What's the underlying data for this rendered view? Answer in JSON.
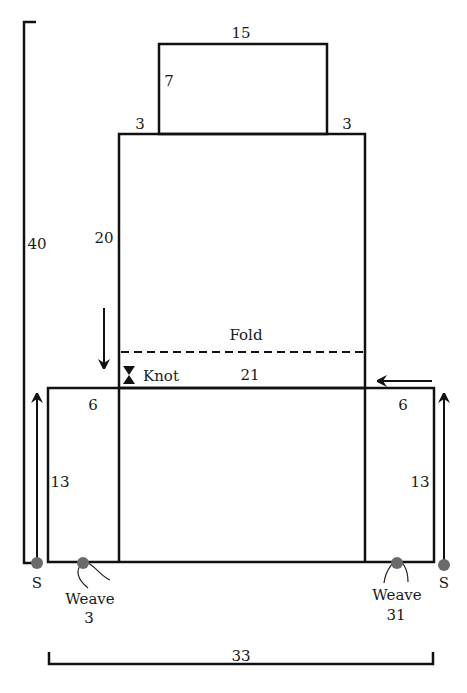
{
  "diagram": {
    "type": "pattern-layout",
    "colors": {
      "line": "#111111",
      "dot": "#6b6b6b",
      "background": "#ffffff"
    },
    "labels": {
      "top_width": "15",
      "top_height": "7",
      "shoulder_left": "3",
      "shoulder_right": "3",
      "middle_height": "20",
      "total_height": "40",
      "fold": "Fold",
      "knot": "Knot",
      "middle_width": "21",
      "side_left_width": "6",
      "side_right_width": "6",
      "side_left_height": "13",
      "side_right_height": "13",
      "start_left": "S",
      "start_right": "S",
      "weave_left": "Weave",
      "weave_left_num": "3",
      "weave_right": "Weave",
      "weave_right_num": "31",
      "total_width": "33"
    }
  }
}
